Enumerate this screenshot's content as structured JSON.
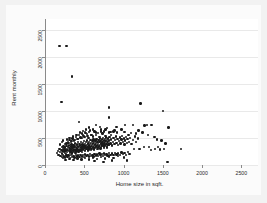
{
  "chart_data": {
    "type": "scatter",
    "title": "",
    "xlabel": "Home size in sqft.",
    "ylabel": "Rent monthly",
    "xlim": [
      0,
      2700
    ],
    "ylim": [
      0,
      2700
    ],
    "xticks": [
      0,
      500,
      1000,
      1500,
      2000,
      2500
    ],
    "xtick_labels": [
      "0",
      "500",
      "1000",
      "1500",
      "2000",
      "2500"
    ],
    "yticks": [
      0,
      500,
      1000,
      1500,
      2000,
      2500
    ],
    "ytick_labels": [
      "0",
      "500",
      "1000",
      "1500",
      "2000",
      "2500"
    ],
    "grid": "horizontal",
    "legend": "none",
    "marker_color": "#1a1a1a",
    "marker_size": 2.4,
    "background_color": "#ffffff",
    "figure_background_color": "#f2f2f2",
    "axis_color": "#8a8a8a",
    "gridline_color": "#e9e9e9",
    "points": [
      [
        170,
        2200
      ],
      [
        260,
        2200
      ],
      [
        330,
        1640
      ],
      [
        195,
        1170
      ],
      [
        800,
        1060
      ],
      [
        1205,
        1140
      ],
      [
        1490,
        1000
      ],
      [
        420,
        790
      ],
      [
        800,
        880
      ],
      [
        640,
        745
      ],
      [
        690,
        700
      ],
      [
        900,
        700
      ],
      [
        1010,
        745
      ],
      [
        1110,
        735
      ],
      [
        1255,
        730
      ],
      [
        1290,
        745
      ],
      [
        1345,
        740
      ],
      [
        1560,
        690
      ],
      [
        1180,
        640
      ],
      [
        960,
        660
      ],
      [
        870,
        640
      ],
      [
        760,
        660
      ],
      [
        600,
        655
      ],
      [
        545,
        610
      ],
      [
        505,
        590
      ],
      [
        470,
        560
      ],
      [
        640,
        600
      ],
      [
        700,
        620
      ],
      [
        820,
        610
      ],
      [
        905,
        600
      ],
      [
        1000,
        610
      ],
      [
        1080,
        590
      ],
      [
        1150,
        580
      ],
      [
        1230,
        600
      ],
      [
        1300,
        560
      ],
      [
        1380,
        520
      ],
      [
        1410,
        470
      ],
      [
        1470,
        450
      ],
      [
        1520,
        400
      ],
      [
        1545,
        60
      ],
      [
        1720,
        300
      ],
      [
        1035,
        80
      ],
      [
        1120,
        300
      ],
      [
        1190,
        300
      ],
      [
        1250,
        330
      ],
      [
        1310,
        330
      ],
      [
        1340,
        280
      ],
      [
        1390,
        300
      ],
      [
        1430,
        330
      ],
      [
        1455,
        290
      ],
      [
        1500,
        300
      ],
      [
        140,
        220
      ],
      [
        150,
        260
      ],
      [
        160,
        190
      ],
      [
        170,
        300
      ],
      [
        180,
        240
      ],
      [
        185,
        170
      ],
      [
        195,
        280
      ],
      [
        200,
        330
      ],
      [
        205,
        210
      ],
      [
        210,
        260
      ],
      [
        215,
        300
      ],
      [
        220,
        180
      ],
      [
        225,
        340
      ],
      [
        230,
        250
      ],
      [
        235,
        290
      ],
      [
        240,
        220
      ],
      [
        245,
        320
      ],
      [
        250,
        270
      ],
      [
        255,
        200
      ],
      [
        260,
        350
      ],
      [
        265,
        300
      ],
      [
        270,
        240
      ],
      [
        275,
        280
      ],
      [
        280,
        330
      ],
      [
        285,
        190
      ],
      [
        290,
        360
      ],
      [
        295,
        260
      ],
      [
        300,
        310
      ],
      [
        305,
        220
      ],
      [
        310,
        290
      ],
      [
        315,
        340
      ],
      [
        320,
        250
      ],
      [
        325,
        380
      ],
      [
        330,
        300
      ],
      [
        335,
        230
      ],
      [
        340,
        320
      ],
      [
        345,
        270
      ],
      [
        350,
        360
      ],
      [
        355,
        290
      ],
      [
        360,
        240
      ],
      [
        365,
        330
      ],
      [
        370,
        400
      ],
      [
        375,
        280
      ],
      [
        380,
        350
      ],
      [
        385,
        250
      ],
      [
        390,
        310
      ],
      [
        395,
        380
      ],
      [
        400,
        290
      ],
      [
        405,
        340
      ],
      [
        410,
        420
      ],
      [
        415,
        260
      ],
      [
        420,
        330
      ],
      [
        425,
        390
      ],
      [
        430,
        300
      ],
      [
        435,
        360
      ],
      [
        440,
        270
      ],
      [
        445,
        430
      ],
      [
        450,
        320
      ],
      [
        455,
        380
      ],
      [
        460,
        290
      ],
      [
        465,
        350
      ],
      [
        470,
        410
      ],
      [
        475,
        300
      ],
      [
        480,
        360
      ],
      [
        485,
        440
      ],
      [
        490,
        320
      ],
      [
        495,
        390
      ],
      [
        500,
        280
      ],
      [
        505,
        350
      ],
      [
        510,
        420
      ],
      [
        515,
        310
      ],
      [
        520,
        370
      ],
      [
        525,
        450
      ],
      [
        530,
        330
      ],
      [
        535,
        400
      ],
      [
        540,
        290
      ],
      [
        545,
        360
      ],
      [
        550,
        430
      ],
      [
        555,
        320
      ],
      [
        560,
        390
      ],
      [
        565,
        460
      ],
      [
        570,
        340
      ],
      [
        575,
        410
      ],
      [
        580,
        300
      ],
      [
        585,
        370
      ],
      [
        590,
        440
      ],
      [
        595,
        330
      ],
      [
        600,
        400
      ],
      [
        605,
        470
      ],
      [
        610,
        350
      ],
      [
        615,
        420
      ],
      [
        620,
        310
      ],
      [
        625,
        380
      ],
      [
        630,
        450
      ],
      [
        635,
        340
      ],
      [
        640,
        410
      ],
      [
        645,
        480
      ],
      [
        650,
        360
      ],
      [
        655,
        430
      ],
      [
        660,
        320
      ],
      [
        665,
        390
      ],
      [
        670,
        460
      ],
      [
        675,
        350
      ],
      [
        680,
        420
      ],
      [
        685,
        490
      ],
      [
        690,
        370
      ],
      [
        695,
        440
      ],
      [
        700,
        330
      ],
      [
        705,
        400
      ],
      [
        710,
        470
      ],
      [
        715,
        360
      ],
      [
        720,
        430
      ],
      [
        725,
        500
      ],
      [
        730,
        380
      ],
      [
        735,
        450
      ],
      [
        740,
        340
      ],
      [
        745,
        410
      ],
      [
        750,
        480
      ],
      [
        755,
        370
      ],
      [
        760,
        440
      ],
      [
        765,
        510
      ],
      [
        770,
        390
      ],
      [
        775,
        460
      ],
      [
        780,
        350
      ],
      [
        785,
        420
      ],
      [
        790,
        490
      ],
      [
        795,
        380
      ],
      [
        800,
        450
      ],
      [
        810,
        520
      ],
      [
        820,
        400
      ],
      [
        830,
        470
      ],
      [
        840,
        360
      ],
      [
        850,
        430
      ],
      [
        860,
        500
      ],
      [
        870,
        390
      ],
      [
        880,
        460
      ],
      [
        890,
        530
      ],
      [
        900,
        410
      ],
      [
        910,
        480
      ],
      [
        920,
        370
      ],
      [
        930,
        440
      ],
      [
        940,
        510
      ],
      [
        950,
        400
      ],
      [
        960,
        470
      ],
      [
        970,
        540
      ],
      [
        980,
        420
      ],
      [
        990,
        490
      ],
      [
        1000,
        380
      ],
      [
        1010,
        450
      ],
      [
        1020,
        520
      ],
      [
        1030,
        410
      ],
      [
        1040,
        480
      ],
      [
        1050,
        550
      ],
      [
        1060,
        430
      ],
      [
        1070,
        500
      ],
      [
        1090,
        390
      ],
      [
        1110,
        460
      ],
      [
        1130,
        530
      ],
      [
        1150,
        420
      ],
      [
        1170,
        490
      ],
      [
        200,
        150
      ],
      [
        215,
        130
      ],
      [
        230,
        160
      ],
      [
        245,
        140
      ],
      [
        260,
        175
      ],
      [
        275,
        145
      ],
      [
        290,
        165
      ],
      [
        305,
        135
      ],
      [
        320,
        180
      ],
      [
        335,
        150
      ],
      [
        350,
        170
      ],
      [
        365,
        140
      ],
      [
        380,
        185
      ],
      [
        395,
        155
      ],
      [
        410,
        175
      ],
      [
        425,
        145
      ],
      [
        440,
        190
      ],
      [
        455,
        160
      ],
      [
        470,
        180
      ],
      [
        485,
        150
      ],
      [
        500,
        195
      ],
      [
        515,
        165
      ],
      [
        530,
        185
      ],
      [
        545,
        155
      ],
      [
        560,
        200
      ],
      [
        575,
        170
      ],
      [
        590,
        190
      ],
      [
        605,
        160
      ],
      [
        620,
        205
      ],
      [
        635,
        175
      ],
      [
        650,
        195
      ],
      [
        665,
        165
      ],
      [
        680,
        210
      ],
      [
        695,
        180
      ],
      [
        710,
        200
      ],
      [
        725,
        170
      ],
      [
        740,
        215
      ],
      [
        755,
        185
      ],
      [
        770,
        205
      ],
      [
        785,
        175
      ],
      [
        800,
        220
      ],
      [
        820,
        190
      ],
      [
        840,
        210
      ],
      [
        860,
        180
      ],
      [
        880,
        225
      ],
      [
        900,
        195
      ],
      [
        920,
        215
      ],
      [
        940,
        185
      ],
      [
        960,
        230
      ],
      [
        980,
        200
      ],
      [
        1000,
        220
      ],
      [
        1020,
        190
      ],
      [
        1045,
        235
      ],
      [
        1065,
        205
      ],
      [
        260,
        400
      ],
      [
        280,
        430
      ],
      [
        300,
        460
      ],
      [
        320,
        420
      ],
      [
        340,
        490
      ],
      [
        360,
        450
      ],
      [
        380,
        520
      ],
      [
        400,
        480
      ],
      [
        420,
        550
      ],
      [
        440,
        510
      ],
      [
        460,
        580
      ],
      [
        480,
        540
      ],
      [
        500,
        610
      ],
      [
        520,
        570
      ],
      [
        540,
        500
      ],
      [
        560,
        640
      ],
      [
        580,
        560
      ],
      [
        600,
        530
      ],
      [
        620,
        620
      ],
      [
        640,
        550
      ],
      [
        660,
        590
      ],
      [
        680,
        520
      ],
      [
        700,
        660
      ],
      [
        720,
        580
      ],
      [
        740,
        620
      ],
      [
        760,
        540
      ],
      [
        780,
        680
      ],
      [
        800,
        600
      ],
      [
        830,
        560
      ],
      [
        860,
        620
      ],
      [
        310,
        250
      ],
      [
        330,
        210
      ],
      [
        355,
        260
      ],
      [
        375,
        225
      ],
      [
        395,
        270
      ],
      [
        415,
        235
      ],
      [
        435,
        280
      ],
      [
        455,
        245
      ],
      [
        475,
        290
      ],
      [
        495,
        255
      ],
      [
        515,
        300
      ],
      [
        535,
        265
      ],
      [
        555,
        310
      ],
      [
        575,
        275
      ],
      [
        595,
        320
      ],
      [
        615,
        285
      ],
      [
        635,
        330
      ],
      [
        655,
        295
      ],
      [
        675,
        340
      ],
      [
        695,
        305
      ],
      [
        715,
        350
      ],
      [
        735,
        315
      ],
      [
        755,
        360
      ],
      [
        775,
        325
      ],
      [
        795,
        370
      ],
      [
        180,
        380
      ],
      [
        200,
        420
      ],
      [
        220,
        450
      ],
      [
        240,
        390
      ],
      [
        265,
        470
      ],
      [
        285,
        410
      ],
      [
        300,
        500
      ],
      [
        325,
        440
      ],
      [
        345,
        530
      ],
      [
        370,
        460
      ],
      [
        390,
        560
      ],
      [
        410,
        480
      ],
      [
        430,
        600
      ],
      [
        450,
        500
      ],
      [
        470,
        630
      ],
      [
        490,
        520
      ],
      [
        510,
        660
      ],
      [
        530,
        540
      ],
      [
        550,
        690
      ],
      [
        570,
        560
      ],
      [
        250,
        90
      ],
      [
        300,
        110
      ],
      [
        350,
        95
      ],
      [
        400,
        120
      ],
      [
        450,
        100
      ],
      [
        500,
        130
      ],
      [
        550,
        105
      ],
      [
        600,
        140
      ],
      [
        650,
        115
      ],
      [
        700,
        150
      ],
      [
        750,
        120
      ],
      [
        800,
        160
      ],
      [
        860,
        130
      ],
      [
        920,
        170
      ],
      [
        990,
        140
      ],
      [
        620,
        70
      ],
      [
        730,
        60
      ],
      [
        840,
        85
      ]
    ]
  },
  "figure": {
    "xaxis_title": "Home size in sqft.",
    "yaxis_title": "Rent monthly"
  }
}
